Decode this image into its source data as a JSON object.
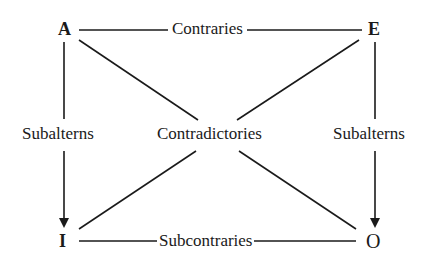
{
  "diagram": {
    "corners": {
      "top_left": "A",
      "top_right": "E",
      "bottom_left": "I",
      "bottom_right": "O"
    },
    "relations": {
      "top": "Contraries",
      "bottom": "Subcontraries",
      "left": "Subalterns",
      "right": "Subalterns",
      "diagonals": "Contradictories"
    },
    "edges": [
      {
        "from": "A",
        "to": "E",
        "label": "Contraries",
        "arrow": false
      },
      {
        "from": "I",
        "to": "O",
        "label": "Subcontraries",
        "arrow": false
      },
      {
        "from": "A",
        "to": "I",
        "label": "Subalterns",
        "arrow": true
      },
      {
        "from": "E",
        "to": "O",
        "label": "Subalterns",
        "arrow": true
      },
      {
        "from": "A",
        "to": "O",
        "label": "Contradictories",
        "arrow": false
      },
      {
        "from": "E",
        "to": "I",
        "label": "Contradictories",
        "arrow": false
      }
    ],
    "line_color": "#1a1a1a"
  }
}
